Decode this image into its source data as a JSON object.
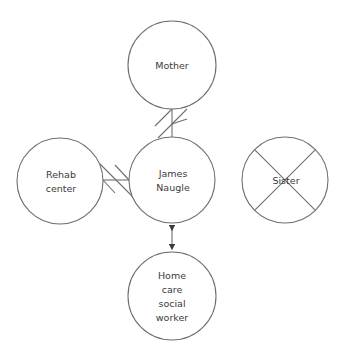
{
  "diagram": {
    "type": "ecomap",
    "nodes": [
      {
        "id": "mother",
        "label": "Mother",
        "cx": 172,
        "cy": 65,
        "r": 44,
        "crossed": false
      },
      {
        "id": "rehab",
        "label": "Rehab\ncenter",
        "cx": 60,
        "cy": 181,
        "r": 43,
        "crossed": false
      },
      {
        "id": "james",
        "label": "James\nNaugle",
        "cx": 172,
        "cy": 180,
        "r": 43,
        "crossed": false
      },
      {
        "id": "sister",
        "label": "Sister",
        "cx": 285,
        "cy": 180,
        "r": 43,
        "crossed": true
      },
      {
        "id": "homecare",
        "label": "Home\ncare\nsocial\nworker",
        "cx": 172,
        "cy": 296,
        "r": 44,
        "crossed": false
      }
    ],
    "edges": [
      {
        "from": "mother",
        "to": "james",
        "style": "conflict",
        "marker": "double-hatch"
      },
      {
        "from": "rehab",
        "to": "james",
        "style": "conflict",
        "marker": "double-hatch"
      },
      {
        "from": "james",
        "to": "homecare",
        "style": "bidirectional-arrow"
      }
    ]
  },
  "labels": {
    "mother": "Mother",
    "rehab": "Rehab\ncenter",
    "james": "James\nNaugle",
    "sister": "Sister",
    "homecare": "Home\ncare\nsocial\nworker"
  }
}
